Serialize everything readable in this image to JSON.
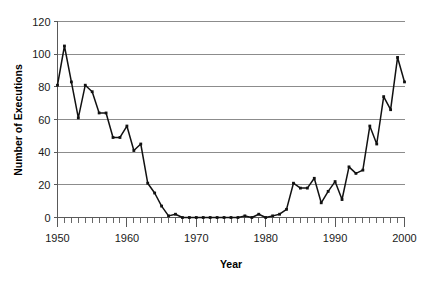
{
  "chart_data": {
    "type": "line",
    "title": "",
    "xlabel": "Year",
    "ylabel": "Number of Executions",
    "xlim": [
      1950,
      2000
    ],
    "ylim": [
      0,
      120
    ],
    "ytick_values": [
      0,
      20,
      40,
      60,
      80,
      100,
      120
    ],
    "ytick_labels": [
      "0",
      "20",
      "40",
      "60",
      "80",
      "100",
      "120"
    ],
    "xtick_values": [
      1950,
      1960,
      1970,
      1980,
      1990,
      2000
    ],
    "xtick_labels": [
      "1950",
      "1960",
      "1970",
      "1980",
      "1990",
      "2000"
    ],
    "xminor_step": 1,
    "grid": "horizontal",
    "legend": "none",
    "marker": "square",
    "line_color": "#111111",
    "grid_color": "#808080",
    "x": [
      1950,
      1951,
      1952,
      1953,
      1954,
      1955,
      1956,
      1957,
      1958,
      1959,
      1960,
      1961,
      1962,
      1963,
      1964,
      1965,
      1966,
      1967,
      1968,
      1969,
      1970,
      1971,
      1972,
      1973,
      1974,
      1975,
      1976,
      1977,
      1978,
      1979,
      1980,
      1981,
      1982,
      1983,
      1984,
      1985,
      1986,
      1987,
      1988,
      1989,
      1990,
      1991,
      1992,
      1993,
      1994,
      1995,
      1996,
      1997,
      1998,
      1999,
      2000
    ],
    "values": [
      81,
      105,
      83,
      61,
      81,
      77,
      64,
      64,
      49,
      49,
      56,
      41,
      45,
      21,
      15,
      7,
      1,
      2,
      0,
      0,
      0,
      0,
      0,
      0,
      0,
      0,
      0,
      1,
      0,
      2,
      0,
      1,
      2,
      5,
      21,
      18,
      18,
      24,
      9,
      16,
      22,
      11,
      31,
      27,
      29,
      56,
      45,
      74,
      66,
      98,
      83
    ],
    "series_name": "Number of Executions"
  },
  "axes": {
    "y_title": "Number of Executions",
    "x_title": "Year"
  }
}
